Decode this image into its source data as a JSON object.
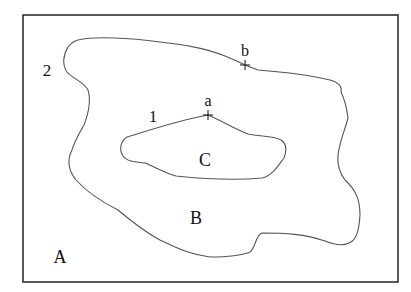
{
  "diagram": {
    "frame": {
      "x": 23,
      "y": 15,
      "width": 375,
      "height": 267,
      "stroke": "#222222"
    },
    "regions": [
      {
        "id": "A",
        "label": "A",
        "x": 60,
        "y": 262
      },
      {
        "id": "B",
        "label": "B",
        "x": 196,
        "y": 223
      },
      {
        "id": "C",
        "label": "C",
        "x": 205,
        "y": 165
      }
    ],
    "curves": [
      {
        "id": "1",
        "label": "1",
        "x": 153,
        "y": 122,
        "description": "inner closed curve bounding region C"
      },
      {
        "id": "2",
        "label": "2",
        "x": 47,
        "y": 75,
        "description": "outer closed curve bounding region B"
      }
    ],
    "points": [
      {
        "id": "a",
        "label": "a",
        "x": 208,
        "y": 115,
        "label_x": 208,
        "label_y": 106,
        "on_curve": "1"
      },
      {
        "id": "b",
        "label": "b",
        "x": 245,
        "y": 65,
        "label_x": 245,
        "label_y": 56,
        "on_curve": "2"
      }
    ],
    "colors": {
      "line": "#555555",
      "text": "#111111",
      "background": "#ffffff"
    }
  }
}
